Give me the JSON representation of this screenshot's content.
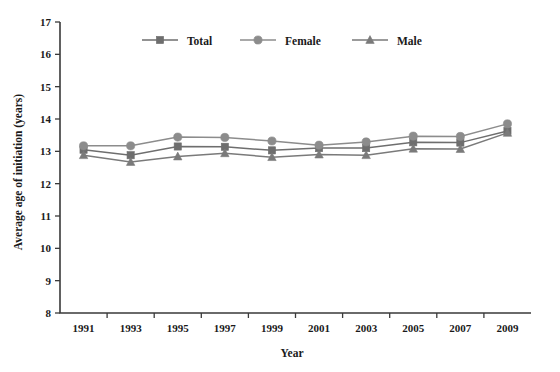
{
  "chart_data": {
    "type": "line",
    "title": "",
    "xlabel": "Year",
    "ylabel": "Average age of initiation (years)",
    "categories": [
      "1991",
      "1993",
      "1995",
      "1997",
      "1999",
      "2001",
      "2003",
      "2005",
      "2007",
      "2009"
    ],
    "x": [
      1991,
      1993,
      1995,
      1997,
      1999,
      2001,
      2003,
      2005,
      2007,
      2009
    ],
    "xlim": [
      1990,
      2010
    ],
    "ylim": [
      8,
      17
    ],
    "ytick_labels": [
      "8",
      "9",
      "10",
      "11",
      "12",
      "13",
      "14",
      "15",
      "16",
      "17"
    ],
    "yticks": [
      8,
      9,
      10,
      11,
      12,
      13,
      14,
      15,
      16,
      17
    ],
    "grid": false,
    "legend_position": "top-center",
    "series": [
      {
        "name": "Total",
        "marker": "square",
        "color": "#6e6e6e",
        "values": [
          13.05,
          12.88,
          13.15,
          13.14,
          13.03,
          13.1,
          13.1,
          13.28,
          13.27,
          13.63
        ]
      },
      {
        "name": "Female",
        "marker": "circle",
        "color": "#8c8c8c",
        "values": [
          13.17,
          13.17,
          13.44,
          13.43,
          13.32,
          13.19,
          13.29,
          13.47,
          13.46,
          13.85
        ]
      },
      {
        "name": "Male",
        "marker": "triangle",
        "color": "#7a7a7a",
        "values": [
          12.88,
          12.67,
          12.84,
          12.94,
          12.82,
          12.9,
          12.88,
          13.08,
          13.07,
          13.57
        ]
      }
    ]
  },
  "legend": {
    "items": [
      {
        "label": "Total",
        "marker": "square-marker-icon"
      },
      {
        "label": "Female",
        "marker": "circle-marker-icon"
      },
      {
        "label": "Male",
        "marker": "triangle-marker-icon"
      }
    ]
  },
  "axes": {
    "x_title": "Year",
    "y_title": "Average age of initiation (years)"
  },
  "colors": {
    "axis": "#3a3a3a",
    "total": "#6e6e6e",
    "female": "#8c8c8c",
    "male": "#7a7a7a",
    "background": "#ffffff"
  }
}
